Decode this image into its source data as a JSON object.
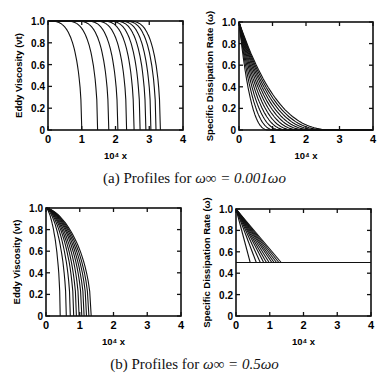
{
  "figure": {
    "caption_a": {
      "prefix": "(a) Profiles for ",
      "math": "ω∞ = 0.001ωo"
    },
    "caption_b": {
      "prefix": "(b) Profiles for ",
      "math": "ω∞ = 0.5ωo"
    }
  },
  "chart_data": [
    {
      "id": "a-left",
      "type": "line",
      "title": "",
      "xlabel": "10⁴ x",
      "ylabel": "Eddy Viscosity (νt)",
      "xlim": [
        0,
        4
      ],
      "ylim": [
        0,
        1.0
      ],
      "xticks": [
        "0",
        "1",
        "2",
        "3",
        "4"
      ],
      "yticks": [
        "0",
        "0.2",
        "0.4",
        "0.6",
        "0.8",
        "1.0"
      ],
      "grid": false,
      "series_description": "Family of ~11 profiles starting at 1.0 and dropping sharply to 0; drop-off positions",
      "front_positions": [
        1.0,
        1.47,
        1.8,
        2.07,
        2.33,
        2.55,
        2.73,
        2.9,
        3.05,
        3.2,
        3.33
      ]
    },
    {
      "id": "a-right",
      "type": "line",
      "title": "",
      "xlabel": "10⁴ x",
      "ylabel": "Specific Dissipation Rate (ω)",
      "xlim": [
        0,
        4
      ],
      "ylim": [
        0,
        1.0
      ],
      "xticks": [
        "0",
        "1",
        "2",
        "3",
        "4"
      ],
      "yticks": [
        "0",
        "0.2",
        "0.4",
        "0.6",
        "0.8",
        "1.0"
      ],
      "grid": false,
      "series_description": "Family of ~11 decaying curves from 1.0 at x=0 to ~0; reach-zero positions",
      "zero_positions": [
        0.9,
        1.1,
        1.3,
        1.5,
        1.7,
        1.9,
        2.1,
        2.3,
        2.5,
        2.7,
        2.9
      ]
    },
    {
      "id": "b-left",
      "type": "line",
      "title": "",
      "xlabel": "10⁴ x",
      "ylabel": "Eddy Viscosity (νt)",
      "xlim": [
        0,
        4
      ],
      "ylim": [
        0,
        1.0
      ],
      "xticks": [
        "0",
        "1",
        "2",
        "3",
        "4"
      ],
      "yticks": [
        "0",
        "0.2",
        "0.4",
        "0.6",
        "0.8",
        "1.0"
      ],
      "grid": false,
      "series_description": "Family of ~11 curves from 1.0 at x=0 falling to 0; front positions",
      "front_positions": [
        0.42,
        0.6,
        0.72,
        0.82,
        0.9,
        0.98,
        1.06,
        1.13,
        1.2,
        1.27,
        1.34
      ]
    },
    {
      "id": "b-right",
      "type": "line",
      "title": "",
      "xlabel": "10⁴ x",
      "ylabel": "Specific Dissipation Rate (ω)",
      "xlim": [
        0,
        4
      ],
      "ylim": [
        0,
        1.0
      ],
      "xticks": [
        "0",
        "1",
        "2",
        "3",
        "4"
      ],
      "yticks": [
        "0",
        "0.2",
        "0.4",
        "0.6",
        "0.8",
        "1.0"
      ],
      "grid": false,
      "series_description": "Family of ~11 linear decays from 1.0 at x=0 to freestream 0.5, then flat at 0.5 to x=4",
      "freestream_value": 0.5,
      "front_positions": [
        0.42,
        0.6,
        0.72,
        0.82,
        0.9,
        0.98,
        1.06,
        1.13,
        1.2,
        1.27,
        1.34
      ]
    }
  ]
}
